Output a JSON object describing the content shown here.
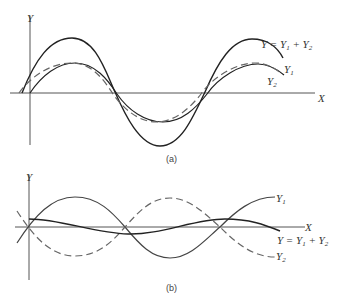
{
  "panel_a": {
    "caption": "(a)",
    "axis_y_label": "Y",
    "axis_x_label": "X",
    "curves": [
      {
        "name": "sum",
        "label": "Y = Y",
        "label_sub1": "1",
        "label_plus": " + Y",
        "label_sub2": "2",
        "style": "solid"
      },
      {
        "name": "y1",
        "label": "Y",
        "label_sub": "1",
        "style": "solid"
      },
      {
        "name": "y2",
        "label": "Y",
        "label_sub": "2",
        "style": "dashed"
      }
    ]
  },
  "panel_b": {
    "caption": "(b)",
    "axis_y_label": "Y",
    "axis_x_label": "X",
    "curves": [
      {
        "name": "y1",
        "label": "Y",
        "label_sub": "1",
        "style": "solid"
      },
      {
        "name": "sum",
        "label": "Y = Y",
        "label_sub1": "1",
        "label_plus": " + Y",
        "label_sub2": "2",
        "style": "solid"
      },
      {
        "name": "y2",
        "label": "Y",
        "label_sub": "2",
        "style": "dashed"
      }
    ]
  },
  "colors": {
    "line": "#222222",
    "axis": "#555555",
    "dashed": "#666666"
  }
}
